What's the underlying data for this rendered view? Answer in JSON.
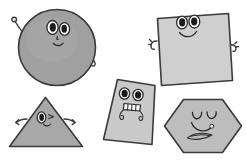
{
  "scene": {
    "title": "Cartoon geometric shapes with faces",
    "background_color": "#ffffff",
    "width": 246,
    "height": 160,
    "shape_count": 5
  },
  "palette": {
    "outline": "#3b3b3b",
    "face_stroke": "#2a2a2a",
    "eye_white": "#ffffff",
    "pupil": "#1c1c1c",
    "circle_fill": "#a0a0a0",
    "square_fill": "#cfcfcf",
    "triangle_fill": "#a8a8a8",
    "quad_fill": "#c9c9c9",
    "hexagon_fill": "#bdbdbd"
  },
  "shapes": [
    {
      "id": "circle",
      "name": "circle",
      "label": "Circle",
      "fill": "#a0a0a0",
      "position": "top-left",
      "center_x": 57,
      "center_y": 47,
      "radius": 38,
      "expression": "smiling",
      "eyes": "two-open-eyes",
      "mouth": "small-smile",
      "has_nose": true,
      "arms": 2
    },
    {
      "id": "square",
      "name": "square",
      "label": "Square",
      "fill": "#cfcfcf",
      "position": "top-right",
      "center_x": 193,
      "center_y": 50,
      "size": 72,
      "rotation": -4,
      "expression": "smiling",
      "eyes": "two-open-eyes",
      "mouth": "wide-smile",
      "has_nose": false,
      "arms": 2
    },
    {
      "id": "triangle",
      "name": "triangle",
      "label": "Triangle",
      "fill": "#a8a8a8",
      "position": "bottom-left",
      "center_x": 46,
      "center_y": 125,
      "width": 76,
      "height": 52,
      "expression": "winking",
      "eyes": "one-open-one-closed",
      "mouth": "tiny-smile",
      "has_nose": false,
      "arms": 2
    },
    {
      "id": "quadrilateral",
      "name": "quadrilateral",
      "label": "Quadrilateral",
      "fill": "#c9c9c9",
      "position": "bottom-center",
      "center_x": 130,
      "center_y": 110,
      "expression": "toothy-grin",
      "eyes": "two-open-eyes",
      "mouth": "toothy-mouth",
      "has_nose": false,
      "arms": 2
    },
    {
      "id": "hexagon",
      "name": "hexagon",
      "label": "Hexagon",
      "fill": "#bdbdbd",
      "position": "bottom-right",
      "center_x": 203,
      "center_y": 126,
      "radius": 41,
      "expression": "content",
      "eyes": "two-closed-arc-eyes",
      "mouth": "wavy-mouth",
      "has_nose": false,
      "arms": 0
    }
  ]
}
